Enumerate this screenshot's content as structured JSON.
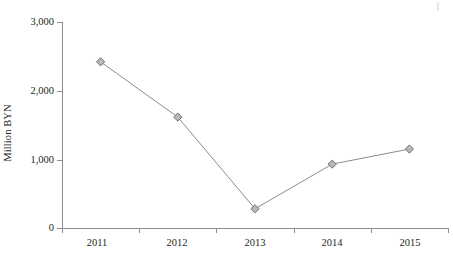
{
  "chart_data": {
    "type": "line",
    "title": "",
    "subtitle": "",
    "xlabel": "",
    "ylabel": "Million BYN",
    "categories": [
      "2011",
      "2012",
      "2013",
      "2014",
      "2015"
    ],
    "values": [
      2420,
      1615,
      280,
      930,
      1150
    ],
    "series": [
      {
        "name": "Million BYN",
        "values": [
          2420,
          1615,
          280,
          930,
          1150
        ]
      }
    ],
    "ylim": [
      0,
      3000
    ],
    "y_ticks": [
      0,
      1000,
      2000,
      3000
    ],
    "y_tick_labels": [
      "0",
      "1,000",
      "2,000",
      "3,000"
    ],
    "x_tick_labels": [
      "2011",
      "2012",
      "2013",
      "2014",
      "2015"
    ],
    "grid": false,
    "legend": null,
    "legend_position": "none",
    "marker_shape": "diamond",
    "annotations": []
  },
  "style": {
    "line_color": "#8c8c8c",
    "marker_fill": "#b9b9b9",
    "marker_stroke": "#6f6f6f",
    "axis_color": "#8d8d8d",
    "text_color": "#231f20",
    "background": "#ffffff"
  }
}
